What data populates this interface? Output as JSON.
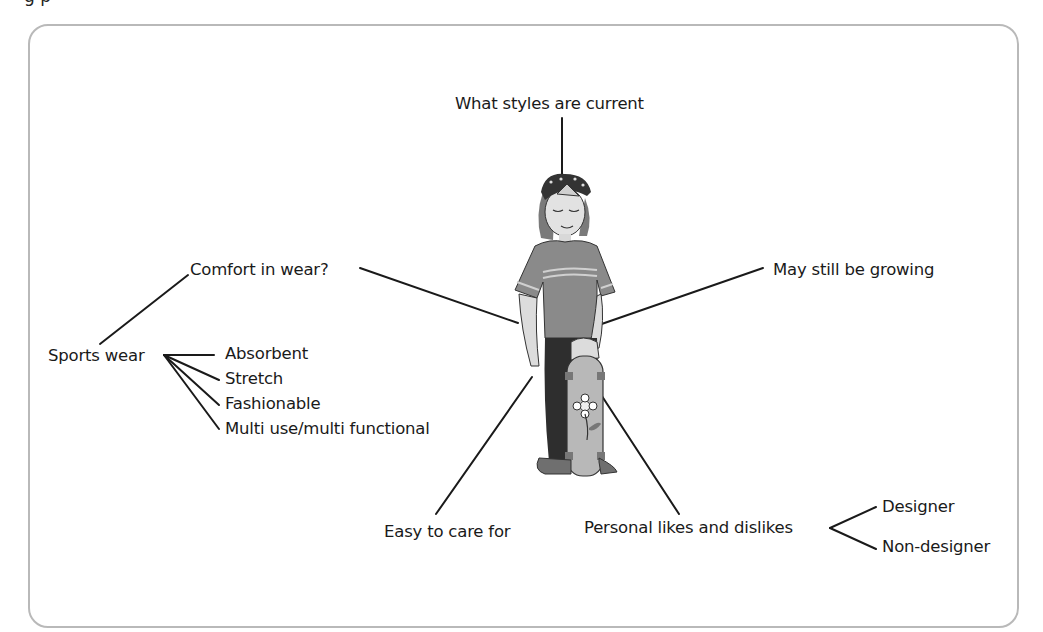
{
  "page": {
    "cut_heading_fragment": "g p"
  },
  "diagram": {
    "center": "girl-with-skateboard-illustration",
    "nodes": {
      "top": "What styles are current",
      "left": "Comfort in wear?",
      "right": "May still be growing",
      "bottom_left": "Easy to care for",
      "bottom_right": "Personal likes and dislikes"
    },
    "sports_wear": {
      "label": "Sports wear",
      "children": [
        "Absorbent",
        "Stretch",
        "Fashionable",
        "Multi use/multi functional"
      ]
    },
    "likes_children": [
      "Designer",
      "Non-designer"
    ]
  },
  "colors": {
    "frame": "#b9b9b9",
    "line": "#1a1a1a",
    "text": "#1a1a1a"
  }
}
